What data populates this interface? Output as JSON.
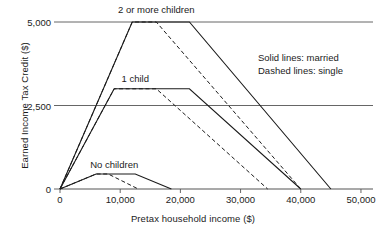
{
  "chart_data": {
    "type": "line",
    "title": "",
    "xlabel": "Pretax household income ($)",
    "ylabel": "Earned Income Tax Credit ($)",
    "xlim": [
      0,
      52000
    ],
    "ylim": [
      0,
      5300
    ],
    "xticks": [
      0,
      10000,
      20000,
      30000,
      40000,
      50000
    ],
    "xticklabels": [
      "0",
      "10,000",
      "20,000",
      "30,000",
      "40,000",
      "50,000"
    ],
    "yticks": [
      0,
      2500,
      5000
    ],
    "yticklabels": [
      "0",
      "2,500",
      "5,000"
    ],
    "grid": "horizontal gridlines at 0, 2500 and 5000",
    "legend_position": "upper right, text only",
    "legend": [
      "Solid lines: married",
      "Dashed lines: single"
    ],
    "annotations": [
      {
        "name": "2 or more children",
        "x": 16000,
        "y": 5000
      },
      {
        "name": "1 child",
        "x": 12500,
        "y": 3000
      },
      {
        "name": "No children",
        "x": 9000,
        "y": 450
      }
    ],
    "series": [
      {
        "name": "2 or more children, married",
        "style": "solid",
        "x": [
          0,
          12000,
          21500,
          45000
        ],
        "y": [
          0,
          5000,
          5000,
          0
        ]
      },
      {
        "name": "2 or more children, single",
        "style": "dashed",
        "x": [
          0,
          12000,
          16000,
          40000
        ],
        "y": [
          0,
          5000,
          5000,
          0
        ]
      },
      {
        "name": "1 child, married",
        "style": "solid",
        "x": [
          0,
          9000,
          21500,
          40000
        ],
        "y": [
          0,
          3000,
          3000,
          0
        ]
      },
      {
        "name": "1 child, single",
        "style": "dashed",
        "x": [
          0,
          9000,
          16000,
          34500
        ],
        "y": [
          0,
          3000,
          3000,
          0
        ]
      },
      {
        "name": "No children, married",
        "style": "solid",
        "x": [
          0,
          6000,
          12500,
          18500
        ],
        "y": [
          0,
          450,
          450,
          0
        ]
      },
      {
        "name": "No children, single",
        "style": "dashed",
        "x": [
          0,
          6000,
          8000,
          13000
        ],
        "y": [
          0,
          450,
          450,
          0
        ]
      }
    ],
    "colors": {
      "line": "#1b1b1b",
      "gridline": "#555555",
      "axis": "#555555",
      "text": "#1b1b1b",
      "background": "#ffffff"
    }
  }
}
